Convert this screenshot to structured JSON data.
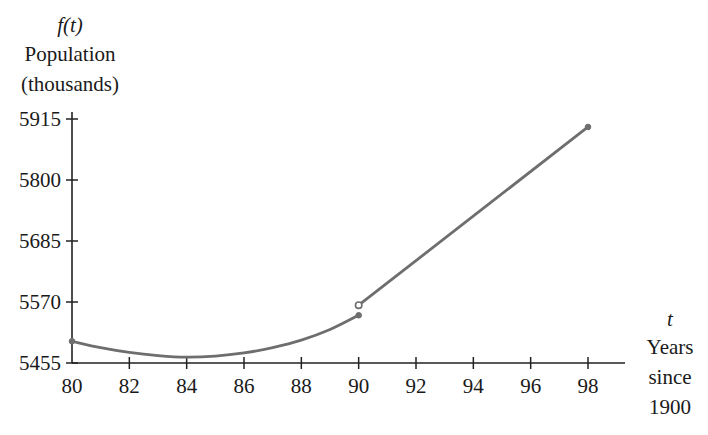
{
  "chart_data": {
    "type": "line",
    "title": "",
    "ylabel_func": "f(t)",
    "ylabel": "Population (thousands)",
    "ylabel_lines": [
      "Population",
      "(thousands)"
    ],
    "xlabel_var": "t",
    "xlabel": "Years since 1900",
    "xlabel_lines": [
      "Years",
      "since",
      "1900"
    ],
    "xlim": [
      80,
      98
    ],
    "ylim": [
      5455,
      5915
    ],
    "x_ticks": [
      80,
      82,
      84,
      86,
      88,
      90,
      92,
      94,
      96,
      98
    ],
    "y_ticks": [
      5455,
      5570,
      5685,
      5800,
      5915
    ],
    "grid": false,
    "legend": null,
    "line_color": "#6e6e6e",
    "series": [
      {
        "name": "piece 1 (quadratic, 80 ≤ t ≤ 90)",
        "style": "curve",
        "x": [
          80,
          81,
          82,
          83,
          84,
          85,
          86,
          87,
          88,
          89,
          90
        ],
        "y": [
          5496,
          5484,
          5475,
          5469,
          5466,
          5468,
          5474,
          5484,
          5498,
          5518,
          5545
        ],
        "start_marker": "filled",
        "end_marker": "filled"
      },
      {
        "name": "piece 2 (linear, 90 < t ≤ 98)",
        "style": "line",
        "x": [
          90,
          98
        ],
        "y": [
          5564,
          5900
        ],
        "start_marker": "open",
        "end_marker": "filled"
      }
    ]
  }
}
